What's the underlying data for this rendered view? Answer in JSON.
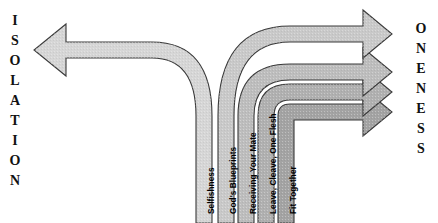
{
  "diagram": {
    "left_word": {
      "name": "isolation",
      "text": "ISOLATION",
      "letters": [
        "I",
        "S",
        "O",
        "L",
        "A",
        "T",
        "I",
        "O",
        "N"
      ]
    },
    "right_word": {
      "name": "oneness",
      "text": "ONENESS",
      "letters": [
        "O",
        "N",
        "E",
        "N",
        "E",
        "S",
        "S"
      ]
    },
    "left_arrow": {
      "label": "Selfishness",
      "direction": "left",
      "fill": "#d6d6d6",
      "stroke": "#3a3a3a"
    },
    "right_arrows": [
      {
        "label": "God's Blueprints",
        "direction": "right",
        "fill": "#c9c9c9",
        "stroke": "#3a3a3a"
      },
      {
        "label": "Receiving Your Mate",
        "direction": "right",
        "fill": "#bdbdbd",
        "stroke": "#3a3a3a"
      },
      {
        "label": "Leave, Cleave, One Flesh",
        "direction": "right",
        "fill": "#b0b0b0",
        "stroke": "#3a3a3a"
      },
      {
        "label": "Fit Together",
        "direction": "right",
        "fill": "#a3a3a3",
        "stroke": "#3a3a3a"
      }
    ],
    "colors": {
      "background": "#ffffff",
      "outline": "#3a3a3a",
      "text": "#000000"
    }
  }
}
